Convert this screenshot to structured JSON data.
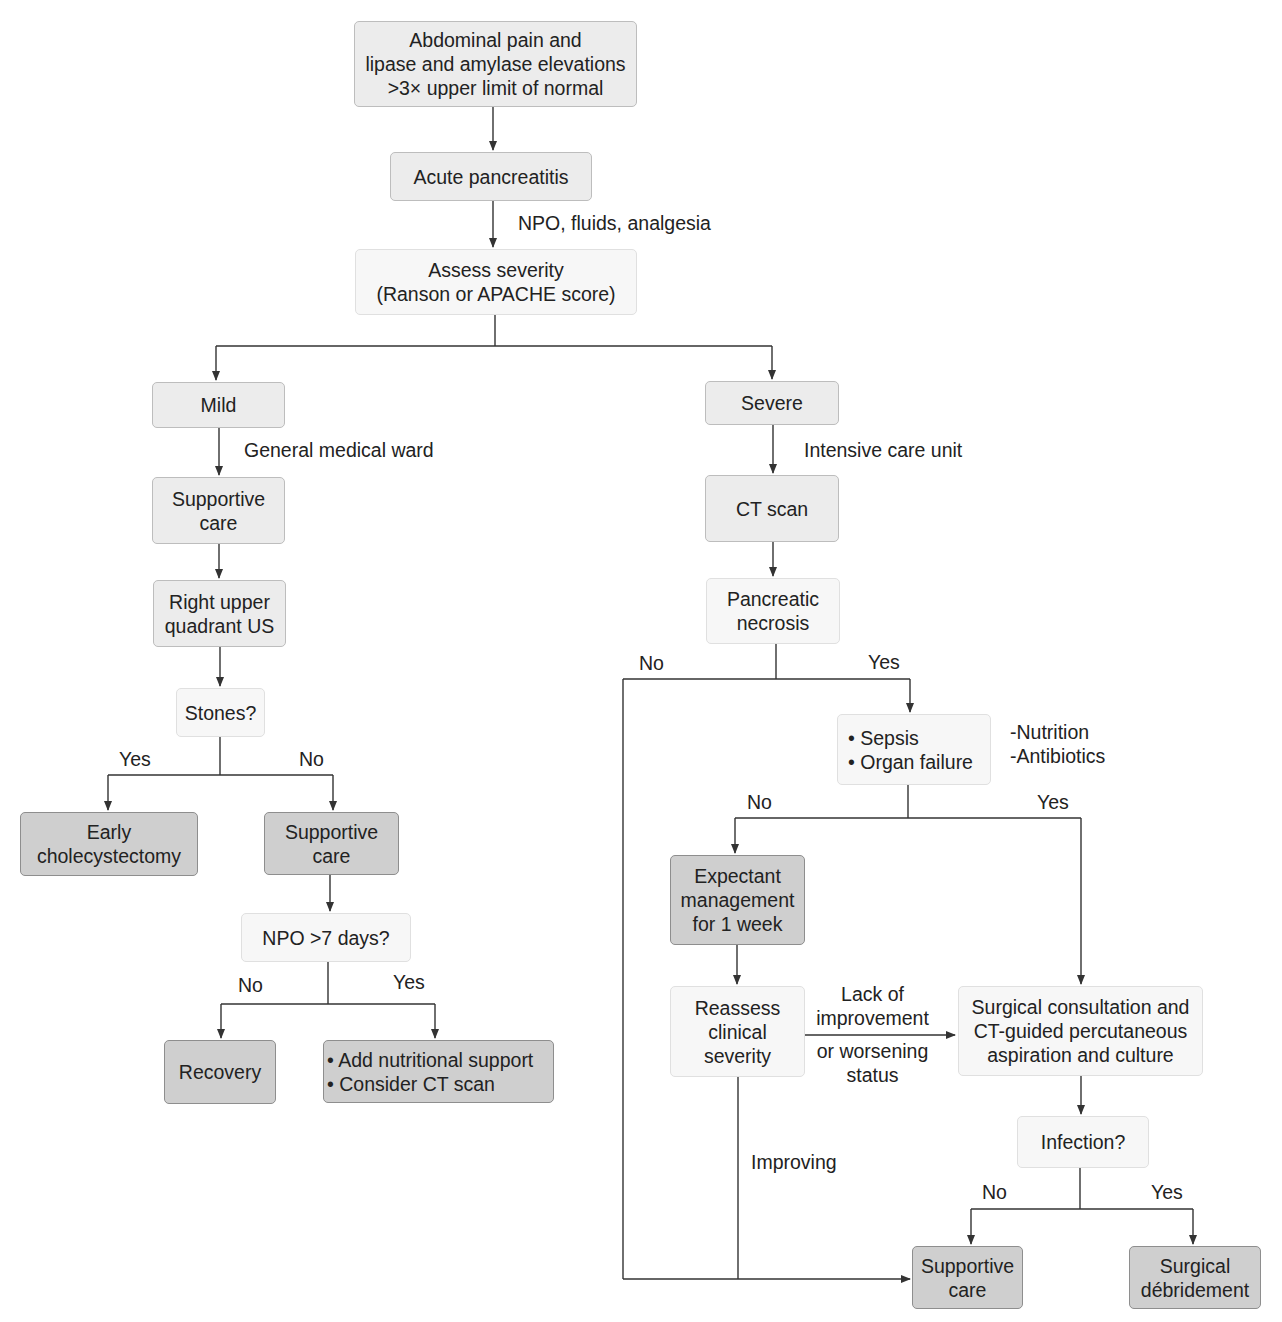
{
  "nodes": {
    "start": "Abdominal pain and\nlipase and amylase elevations\n>3× upper limit of normal",
    "acute": "Acute pancreatitis",
    "assess": "Assess severity\n(Ranson or APACHE score)",
    "mild": "Mild",
    "severe": "Severe",
    "supportive_mild": "Supportive\ncare",
    "ruq_us": "Right upper\nquadrant US",
    "stones": "Stones?",
    "early_chole": "Early\ncholecystectomy",
    "supportive_no_stones": "Supportive\ncare",
    "npo_7": "NPO >7 days?",
    "recovery": "Recovery",
    "nutrition_ct": "• Add nutritional support\n• Consider CT scan",
    "ct_scan": "CT scan",
    "necrosis": "Pancreatic\nnecrosis",
    "sepsis": "• Sepsis\n• Organ failure",
    "expectant": "Expectant\nmanagement\nfor 1 week",
    "reassess": "Reassess\nclinical\nseverity",
    "surgical_consult": "Surgical consultation and\nCT-guided percutaneous\naspiration and culture",
    "infection": "Infection?",
    "supportive_final": "Supportive\ncare",
    "debridement": "Surgical\ndébridement"
  },
  "labels": {
    "npo_fluids": "NPO, fluids, analgesia",
    "general_ward": "General medical ward",
    "icu": "Intensive care unit",
    "stones_yes": "Yes",
    "stones_no": "No",
    "npo7_no": "No",
    "npo7_yes": "Yes",
    "necrosis_no": "No",
    "necrosis_yes": "Yes",
    "nutrition_antibiotics": "-Nutrition\n-Antibiotics",
    "sepsis_no": "No",
    "sepsis_yes": "Yes",
    "lack_improvement": "Lack of\nimprovement",
    "worsening": "or worsening\nstatus",
    "improving": "Improving",
    "infection_no": "No",
    "infection_yes": "Yes"
  },
  "colors": {
    "process_fill": "#ececec",
    "light_fill": "#f7f7f7",
    "outcome_fill": "#cfcfcf",
    "line": "#333333"
  }
}
